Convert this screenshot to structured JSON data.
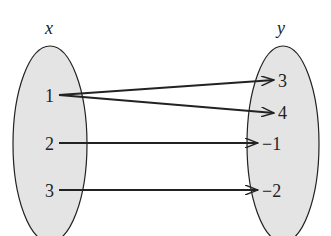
{
  "diagram": {
    "type": "mapping",
    "domain_label": "x",
    "range_label": "y",
    "domain": [
      "1",
      "2",
      "3"
    ],
    "range": [
      "3",
      "4",
      "−1",
      "−2"
    ],
    "mappings": [
      {
        "from": "1",
        "to": "3"
      },
      {
        "from": "1",
        "to": "4"
      },
      {
        "from": "2",
        "to": "−1"
      },
      {
        "from": "3",
        "to": "−2"
      }
    ],
    "colors": {
      "set_fill": "#e4e4e4",
      "stroke": "#222222"
    }
  }
}
